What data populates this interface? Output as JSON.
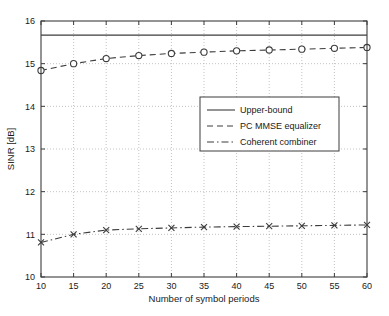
{
  "chart_data": {
    "type": "line",
    "title": "",
    "xlabel": "Number of symbol periods",
    "ylabel": "SINR [dB]",
    "xlim": [
      10,
      60
    ],
    "ylim": [
      10,
      16
    ],
    "xticks": [
      10,
      15,
      20,
      25,
      30,
      35,
      40,
      45,
      50,
      55,
      60
    ],
    "yticks": [
      10,
      11,
      12,
      13,
      14,
      15,
      16
    ],
    "xtick_labels": [
      "10",
      "15",
      "20",
      "25",
      "30",
      "35",
      "40",
      "45",
      "50",
      "55",
      "60"
    ],
    "ytick_labels": [
      "10",
      "11",
      "12",
      "13",
      "14",
      "15",
      "16"
    ],
    "grid": true,
    "grid_style": "dotted",
    "legend_position": "center",
    "x": [
      10,
      15,
      20,
      25,
      30,
      35,
      40,
      45,
      50,
      55,
      60
    ],
    "series": [
      {
        "name": "Upper-bound",
        "style": "solid",
        "marker": "none",
        "color": "#3c3c3c",
        "values": [
          15.67,
          15.67,
          15.67,
          15.67,
          15.67,
          15.67,
          15.67,
          15.67,
          15.67,
          15.67,
          15.67
        ]
      },
      {
        "name": "PC MMSE equalizer",
        "style": "dashed",
        "marker": "circle",
        "color": "#3c3c3c",
        "values": [
          14.84,
          15.0,
          15.12,
          15.19,
          15.24,
          15.27,
          15.3,
          15.32,
          15.34,
          15.36,
          15.38
        ]
      },
      {
        "name": "Coherent combiner",
        "style": "dash-dot",
        "marker": "x",
        "color": "#3c3c3c",
        "values": [
          10.81,
          11.0,
          11.1,
          11.13,
          11.15,
          11.17,
          11.18,
          11.19,
          11.2,
          11.21,
          11.22
        ]
      }
    ]
  },
  "legend": {
    "entries": [
      {
        "label": "Upper-bound",
        "style": "solid"
      },
      {
        "label": "PC MMSE equalizer",
        "style": "dashed"
      },
      {
        "label": "Coherent combiner",
        "style": "dash-dot"
      }
    ]
  },
  "axes": {
    "x_title": "Number of symbol periods",
    "y_title": "SINR [dB]"
  }
}
